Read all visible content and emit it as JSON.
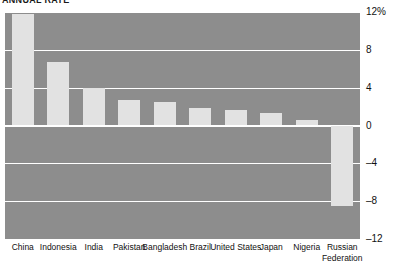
{
  "chart_data": {
    "type": "bar",
    "title": "ANNUAL RATE",
    "xlabel": "",
    "ylabel": "",
    "ylim": [
      -12,
      12
    ],
    "yticks": [
      12,
      8,
      4,
      0,
      -4,
      -8,
      -12
    ],
    "ytick_labels": [
      "12%",
      "8",
      "4",
      "0",
      "-4",
      "-8",
      "-12"
    ],
    "grid": true,
    "legend": "none",
    "categories": [
      "China",
      "Indonesia",
      "India",
      "Pakistan",
      "Bangladesh",
      "Brazil",
      "United States",
      "Japan",
      "Nigeria",
      "Russian Federation"
    ],
    "values": [
      11.8,
      6.7,
      4.0,
      2.7,
      2.5,
      1.8,
      1.6,
      1.3,
      0.6,
      -8.5
    ],
    "colors": {
      "plot_background": "#8d8d8d",
      "bar": "#e2e2e2",
      "gridline": "#ffffff",
      "text": "#111111",
      "page_background": "#ffffff"
    }
  }
}
